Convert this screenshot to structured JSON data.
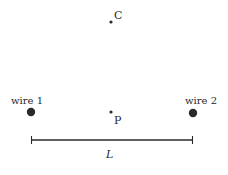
{
  "diagram": {
    "points": {
      "C": {
        "label": "C",
        "x": 111,
        "y": 22
      },
      "P": {
        "label": "P",
        "x": 111,
        "y": 112
      }
    },
    "wires": [
      {
        "label": "wire 1",
        "x": 31,
        "y": 112
      },
      {
        "label": "wire 2",
        "x": 193,
        "y": 113
      }
    ],
    "dimension": {
      "label": "L",
      "x1": 31,
      "x2": 193,
      "y": 140
    },
    "colors": {
      "ink": "#2a2a2a",
      "background": "#ffffff"
    }
  }
}
